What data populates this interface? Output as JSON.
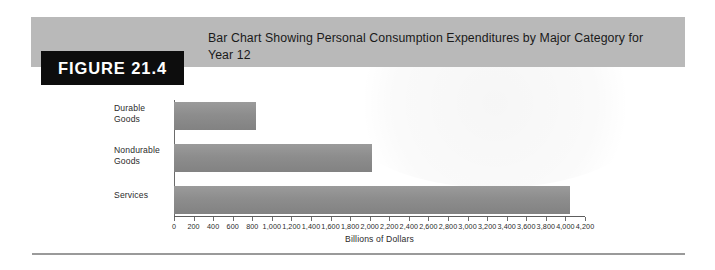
{
  "figure": {
    "tab_label": "FIGURE 21.4",
    "title": "Bar Chart Showing Personal Consumption Expenditures by Major Category for Year 12"
  },
  "colors": {
    "header_band": "#b9b9b9",
    "tab_background": "#0d0d0d",
    "tab_text": "#ffffff",
    "bar_fill": "#8d8d8d",
    "axis": "#5d5d5d",
    "rule": "#9a9a9a"
  },
  "chart_data": {
    "type": "bar",
    "orientation": "horizontal",
    "title": "Bar Chart Showing Personal Consumption Expenditures by Major Category for Year 12",
    "categories": [
      "Durable Goods",
      "Nondurable Goods",
      "Services"
    ],
    "values": [
      840,
      2020,
      4050
    ],
    "xlabel": "Billions of Dollars",
    "ylabel": "",
    "xlim": [
      0,
      4200
    ],
    "xticks": [
      0,
      200,
      400,
      600,
      800,
      1000,
      1200,
      1400,
      1600,
      1800,
      2000,
      2200,
      2400,
      2600,
      2800,
      3000,
      3200,
      3400,
      3600,
      3800,
      4000,
      4200
    ],
    "xtick_labels": [
      "0",
      "200",
      "400",
      "600",
      "800",
      "1,000",
      "1,200",
      "1,400",
      "1,600",
      "1,800",
      "2,000",
      "2,200",
      "2,400",
      "2,600",
      "2,800",
      "3,000",
      "3,200",
      "3,400",
      "3,600",
      "3,800",
      "4,000",
      "4,200"
    ],
    "grid": false,
    "legend": false
  }
}
